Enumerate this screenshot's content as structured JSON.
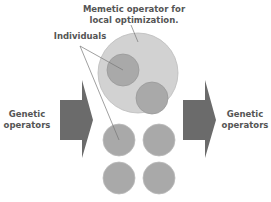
{
  "labels": {
    "memetic_line1": "Memetic operator for",
    "memetic_line2": "local optimization.",
    "individuals": "Individuals",
    "left_line1": "Genetic",
    "left_line2": "operators",
    "right_line1": "Genetic",
    "right_line2": "operators"
  },
  "colors": {
    "arrow": "#6b6b6b",
    "large_circle": "#cfcfcf",
    "small_circle": "#a9a9a9",
    "circle_stroke": "#999999",
    "text": "#555555"
  }
}
